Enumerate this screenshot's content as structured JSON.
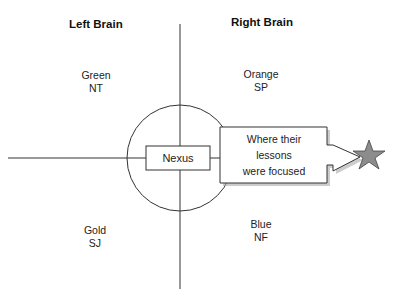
{
  "headers": {
    "left": "Left Brain",
    "right": "Right Brain"
  },
  "quadrants": [
    {
      "id": "top-left",
      "color": "Green",
      "code": "NT"
    },
    {
      "id": "top-right",
      "color": "Orange",
      "code": "SP"
    },
    {
      "id": "bottom-left",
      "color": "Gold",
      "code": "SJ"
    },
    {
      "id": "bottom-right",
      "color": "Blue",
      "code": "NF"
    }
  ],
  "center": {
    "label": "Nexus"
  },
  "callout": {
    "line1": "Where their",
    "line2": "lessons",
    "line3": "were focused"
  },
  "colors": {
    "stroke": "#333333",
    "star_fill": "#8c8c8c",
    "shadow": "#aaaaaa"
  }
}
